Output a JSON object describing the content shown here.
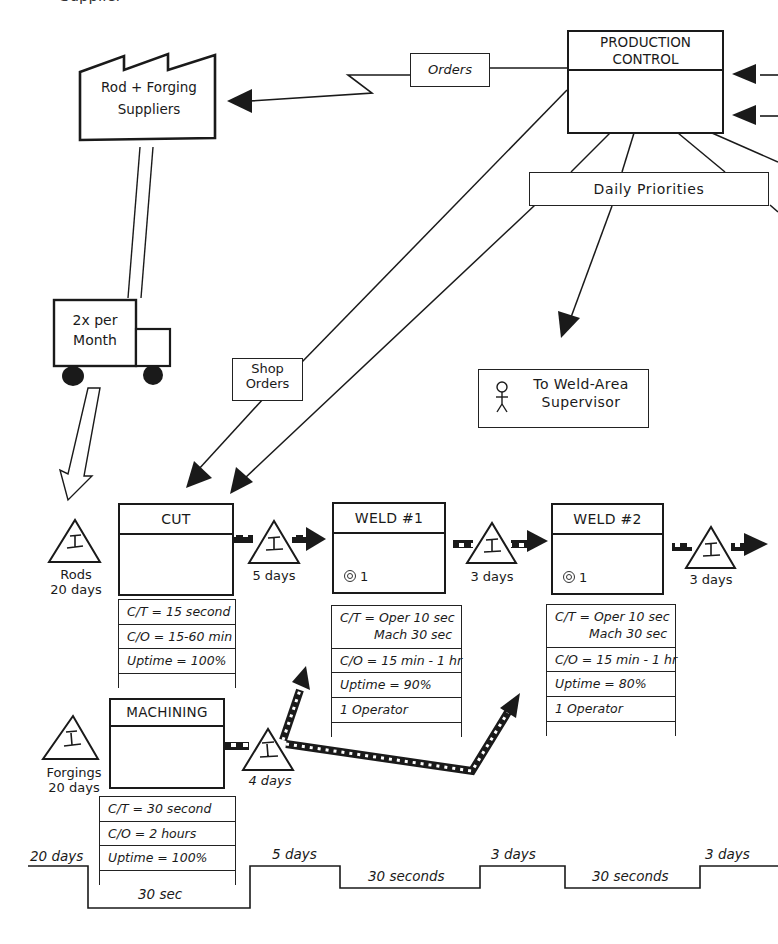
{
  "title_fragment": "Supplier",
  "supplier": {
    "label_line1": "Rod + Forging",
    "label_line2": "Suppliers"
  },
  "production_control": {
    "line1": "PRODUCTION",
    "line2": "CONTROL"
  },
  "info_flows": {
    "orders": "Orders",
    "daily_priorities": "Daily Priorities",
    "shop_orders_line1": "Shop",
    "shop_orders_line2": "Orders"
  },
  "supervisor": {
    "line1": "To Weld-Area",
    "line2": "Supervisor",
    "icon": "person-icon"
  },
  "truck": {
    "line1": "2x per",
    "line2": "Month"
  },
  "inventory": [
    {
      "id": "rods",
      "line1": "Rods",
      "line2": "20 days"
    },
    {
      "id": "cut-weld1",
      "line1": "5 days"
    },
    {
      "id": "weld1-weld2",
      "line1": "3 days"
    },
    {
      "id": "after-weld2",
      "line1": "3 days"
    },
    {
      "id": "forgings",
      "line1": "Forgings",
      "line2": "20 days"
    },
    {
      "id": "after-machining",
      "line1": "4 days"
    }
  ],
  "processes": [
    {
      "id": "cut",
      "name": "CUT",
      "operators": "",
      "data": [
        "C/T = 15 second",
        "C/O = 15-60 min",
        "Uptime = 100%"
      ]
    },
    {
      "id": "weld1",
      "name": "WELD #1",
      "operators": "1",
      "data": [
        "C/T = Oper 10 sec",
        "Mach 30 sec",
        "C/O =  15 min - 1 hr",
        "Uptime = 90%",
        "1 Operator"
      ]
    },
    {
      "id": "weld2",
      "name": "WELD #2",
      "operators": "1",
      "data": [
        "C/T = Oper 10 sec",
        "Mach 30 sec",
        "C/O =  15 min - 1 hr",
        "Uptime = 80%",
        "1 Operator"
      ]
    },
    {
      "id": "machining",
      "name": "MACHINING",
      "operators": "",
      "data": [
        "C/T = 30 second",
        "C/O =  2 hours",
        "Uptime = 100%"
      ]
    }
  ],
  "timeline": {
    "upper": [
      "20 days",
      "5 days",
      "3 days",
      "3 days"
    ],
    "lower": [
      "30 sec",
      "30 seconds",
      "30 seconds"
    ]
  },
  "colors": {
    "ink": "#1a1a1a",
    "background": "#ffffff"
  }
}
